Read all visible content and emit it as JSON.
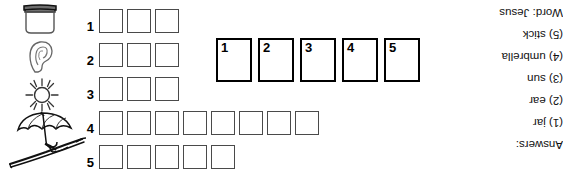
{
  "puzzle": {
    "rows": [
      {
        "number": "1",
        "boxes": 3
      },
      {
        "number": "2",
        "boxes": 3
      },
      {
        "number": "3",
        "boxes": 3
      },
      {
        "number": "4",
        "boxes": 8
      },
      {
        "number": "5",
        "boxes": 5
      }
    ]
  },
  "answer_boxes": [
    {
      "number": "1"
    },
    {
      "number": "2"
    },
    {
      "number": "3"
    },
    {
      "number": "4"
    },
    {
      "number": "5"
    }
  ],
  "illustrations": [
    {
      "name": "jar-illustration",
      "label": "jar"
    },
    {
      "name": "ear-illustration",
      "label": "ear"
    },
    {
      "name": "sun-illustration",
      "label": "sun"
    },
    {
      "name": "umbrella-illustration",
      "label": "umbrella"
    },
    {
      "name": "stick-illustration",
      "label": "stick"
    }
  ],
  "answers_key": {
    "heading": "Answers:",
    "lines": [
      "(1) jar",
      "(2) ear",
      "(3) sun",
      "(4) umbrella",
      "(5) stick"
    ],
    "word_line": "Word: Jesus"
  }
}
